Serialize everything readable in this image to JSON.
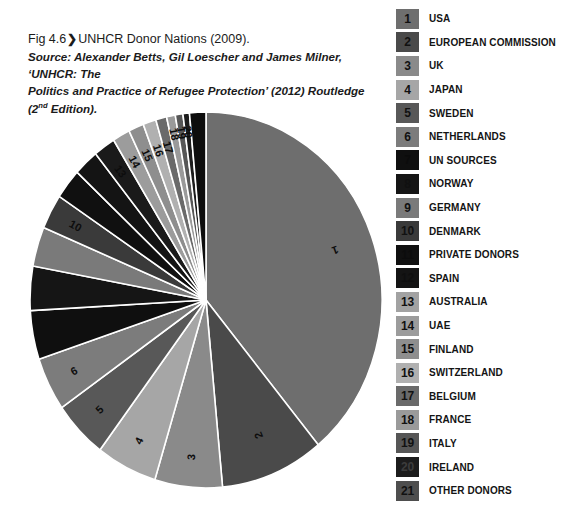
{
  "figure": {
    "label": "Fig 4.6",
    "chevron": "❯",
    "title": "UNHCR Donor Nations (2009).",
    "source_prefix": "Source: Alexander Betts, Gil Loescher and James Milner, ‘UNHCR: The",
    "source_line2a": "Politics and Practice of Refugee Protection’ (2012) Routledge (2",
    "source_sup": "nd",
    "source_line2b": " Edition)."
  },
  "chart_data": {
    "type": "pie",
    "title": "UNHCR Donor Nations (2009)",
    "start_angle_deg": 0,
    "direction": "clockwise",
    "legend_position": "right",
    "grid": false,
    "categories": [
      "USA",
      "EUROPEAN COMMISSION",
      "UK",
      "JAPAN",
      "SWEDEN",
      "NETHERLANDS",
      "UN SOURCES",
      "NORWAY",
      "GERMANY",
      "DENMARK",
      "PRIVATE DONORS",
      "SPAIN",
      "AUSTRALIA",
      "UAE",
      "FINLAND",
      "SWITZERLAND",
      "BELGIUM",
      "FRANCE",
      "ITALY",
      "IRELAND",
      "OTHER DONORS"
    ],
    "values": [
      39.0,
      9.5,
      6.2,
      5.6,
      5.0,
      4.6,
      4.2,
      3.8,
      3.4,
      3.0,
      2.6,
      2.3,
      2.0,
      1.6,
      1.4,
      1.2,
      1.0,
      0.8,
      0.7,
      0.6,
      1.5
    ],
    "slice_colors": [
      "#6e6e6e",
      "#4a4a4a",
      "#8a8a8a",
      "#a6a6a6",
      "#585858",
      "#7c7c7c",
      "#0f0f0f",
      "#151515",
      "#7a7a7a",
      "#3a3a3a",
      "#101010",
      "#141414",
      "#1a1a1a",
      "#9c9c9c",
      "#8e8e8e",
      "#b0b0b0",
      "#6a6a6a",
      "#9a9a9a",
      "#565656",
      "#1c1c1c",
      "#0d0d0d"
    ],
    "slice_label_visible": [
      true,
      true,
      true,
      true,
      true,
      true,
      false,
      false,
      false,
      true,
      false,
      false,
      true,
      true,
      true,
      true,
      true,
      true,
      true,
      true,
      true
    ]
  },
  "legend": {
    "items": [
      {
        "num": "1",
        "label": "USA",
        "swatch": "#6e6e6e",
        "num_color": "#101010"
      },
      {
        "num": "2",
        "label": "EUROPEAN COMMISSION",
        "swatch": "#4a4a4a",
        "num_color": "#111111"
      },
      {
        "num": "3",
        "label": "UK",
        "swatch": "#8a8a8a",
        "num_color": "#111111"
      },
      {
        "num": "4",
        "label": "JAPAN",
        "swatch": "#a6a6a6",
        "num_color": "#111111"
      },
      {
        "num": "5",
        "label": "SWEDEN",
        "swatch": "#585858",
        "num_color": "#111111"
      },
      {
        "num": "6",
        "label": "NETHERLANDS",
        "swatch": "#7c7c7c",
        "num_color": "#111111"
      },
      {
        "num": "7",
        "label": "UN SOURCES",
        "swatch": "#0f0f0f",
        "num_color": "#0b0b0b"
      },
      {
        "num": "8",
        "label": "NORWAY",
        "swatch": "#151515",
        "num_color": "#101010"
      },
      {
        "num": "9",
        "label": "GERMANY",
        "swatch": "#7a7a7a",
        "num_color": "#111111"
      },
      {
        "num": "10",
        "label": "DENMARK",
        "swatch": "#3a3a3a",
        "num_color": "#111111"
      },
      {
        "num": "11",
        "label": "PRIVATE DONORS",
        "swatch": "#101010",
        "num_color": "#0c0c0c"
      },
      {
        "num": "12",
        "label": "SPAIN",
        "swatch": "#141414",
        "num_color": "#0f0f0f"
      },
      {
        "num": "13",
        "label": "AUSTRALIA",
        "swatch": "#a2a2a2",
        "num_color": "#111111"
      },
      {
        "num": "14",
        "label": "UAE",
        "swatch": "#9c9c9c",
        "num_color": "#111111"
      },
      {
        "num": "15",
        "label": "FINLAND",
        "swatch": "#8e8e8e",
        "num_color": "#111111"
      },
      {
        "num": "16",
        "label": "SWITZERLAND",
        "swatch": "#b0b0b0",
        "num_color": "#111111"
      },
      {
        "num": "17",
        "label": "BELGIUM",
        "swatch": "#6a6a6a",
        "num_color": "#111111"
      },
      {
        "num": "18",
        "label": "FRANCE",
        "swatch": "#9a9a9a",
        "num_color": "#111111"
      },
      {
        "num": "19",
        "label": "ITALY",
        "swatch": "#565656",
        "num_color": "#111111"
      },
      {
        "num": "20",
        "label": "IRELAND",
        "swatch": "#1c1c1c",
        "num_color": "#3c3c3c"
      },
      {
        "num": "21",
        "label": "OTHER DONORS",
        "swatch": "#4e4e4e",
        "num_color": "#111111"
      }
    ]
  }
}
